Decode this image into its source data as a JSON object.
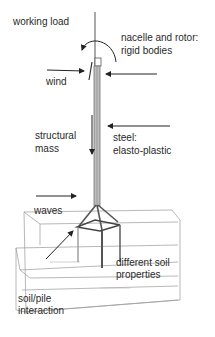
{
  "labels": {
    "working_load": "working load",
    "nacelle_line1": "nacelle and rotor:",
    "nacelle_line2": "rigid bodies",
    "wind": "wind",
    "structural_line1": "structural",
    "structural_line2": "mass",
    "steel_line1": "steel:",
    "steel_line2": "elasto-plastic",
    "waves": "waves",
    "soil_line1": "different soil",
    "soil_line2": "properties",
    "pile_line1": "soil/pile",
    "pile_line2": "interaction"
  },
  "colors": {
    "ink": "#222222",
    "sketch": "#8a8a8a",
    "tower": "#9a9a9a"
  }
}
